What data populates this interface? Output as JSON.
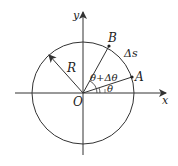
{
  "diagram": {
    "type": "circle-arc-geometry",
    "origin_label": "O",
    "x_axis_label": "x",
    "y_axis_label": "y",
    "radius_label": "R",
    "point_a_label": "A",
    "point_b_label": "B",
    "arc_label": "Δs",
    "angle_theta_label": "θ",
    "angle_theta_plus_label": "θ+Δθ",
    "line_color": "#333333"
  }
}
